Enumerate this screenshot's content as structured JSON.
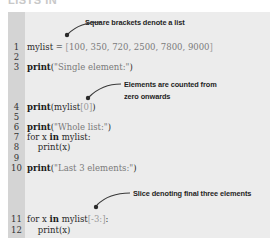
{
  "heading_cutoff": "LISTS IN",
  "annotations": {
    "brackets": "Square brackets denote a list",
    "counted_line1": "Elements are counted from",
    "counted_line2": "zero onwards",
    "slice": "Slice denoting final three elements"
  },
  "lines": [
    {
      "num": "1",
      "parts": [
        [
          "mylist = ",
          "n"
        ],
        [
          "[",
          "b"
        ],
        [
          "100, 350, 720, 2500, 7800, 9000",
          "s"
        ],
        [
          "]",
          "b"
        ]
      ]
    },
    {
      "num": "2",
      "parts": []
    },
    {
      "num": "3",
      "parts": [
        [
          "print",
          "k"
        ],
        [
          "(",
          "n"
        ],
        [
          "\"Single element:\"",
          "s"
        ],
        [
          ")",
          "n"
        ]
      ]
    },
    {
      "num": "4",
      "parts": [
        [
          "print",
          "k"
        ],
        [
          "(mylist",
          "n"
        ],
        [
          "[0]",
          "b"
        ],
        [
          ")",
          "n"
        ]
      ]
    },
    {
      "num": "5",
      "parts": []
    },
    {
      "num": "6",
      "parts": [
        [
          "print",
          "k"
        ],
        [
          "(",
          "n"
        ],
        [
          "\"Whole list:\"",
          "s"
        ],
        [
          ")",
          "n"
        ]
      ]
    },
    {
      "num": "7",
      "parts": [
        [
          "for x ",
          "n"
        ],
        [
          "in",
          "k"
        ],
        [
          " mylist:",
          "n"
        ]
      ]
    },
    {
      "num": "8",
      "parts": [
        [
          "    print(x)",
          "n"
        ]
      ]
    },
    {
      "num": "9",
      "parts": []
    },
    {
      "num": "10",
      "parts": [
        [
          "print",
          "k"
        ],
        [
          "(",
          "n"
        ],
        [
          "\"Last 3 elements:\"",
          "s"
        ],
        [
          ")",
          "n"
        ]
      ]
    },
    {
      "num": "11",
      "parts": [
        [
          "for x ",
          "n"
        ],
        [
          "in",
          "k"
        ],
        [
          " mylist",
          "n"
        ],
        [
          "[-3:]",
          "b"
        ],
        [
          ":",
          "n"
        ]
      ]
    },
    {
      "num": "12",
      "parts": [
        [
          "    print(x)",
          "n"
        ]
      ]
    }
  ]
}
